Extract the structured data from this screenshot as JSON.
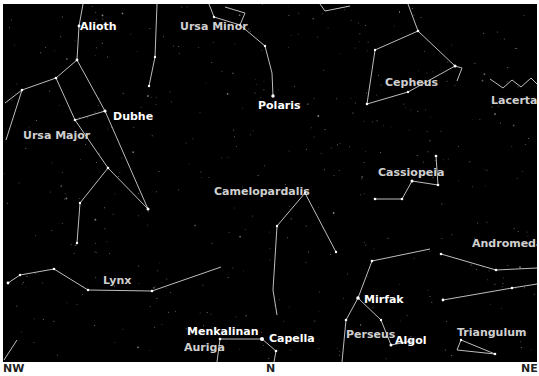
{
  "chart_data": {
    "type": "star-map",
    "title": "",
    "horizon_directions": [
      {
        "label": "NW",
        "x": 3
      },
      {
        "label": "N",
        "x": 270
      },
      {
        "label": "NE",
        "x": 525
      }
    ],
    "constellations": [
      {
        "name": "Ursa Minor",
        "label_x": 207,
        "label_y": 24
      },
      {
        "name": "Cepheus",
        "label_x": 386,
        "label_y": 77
      },
      {
        "name": "Lacerta",
        "label_x": 491,
        "label_y": 95
      },
      {
        "name": "Ursa Major",
        "label_x": 22,
        "label_y": 129
      },
      {
        "name": "Cassiopeia",
        "label_x": 378,
        "label_y": 166
      },
      {
        "name": "Camelopardalis",
        "label_x": 214,
        "label_y": 186
      },
      {
        "name": "Andromeda",
        "label_x": 471,
        "label_y": 238
      },
      {
        "name": "Lynx",
        "label_x": 103,
        "label_y": 275
      },
      {
        "name": "Auriga",
        "label_x": 184,
        "label_y": 342
      },
      {
        "name": "Perseus",
        "label_x": 345,
        "label_y": 328
      },
      {
        "name": "Triangulum",
        "label_x": 456,
        "label_y": 327
      }
    ],
    "stars": [
      {
        "name": "Alioth",
        "label_x": 83,
        "label_y": 25
      },
      {
        "name": "Polaris",
        "label_x": 258,
        "label_y": 100
      },
      {
        "name": "Dubhe",
        "label_x": 112,
        "label_y": 111
      },
      {
        "name": "Mirfak",
        "label_x": 363,
        "label_y": 294
      },
      {
        "name": "Algol",
        "label_x": 394,
        "label_y": 335
      },
      {
        "name": "Menkalinan",
        "label_x": 187,
        "label_y": 326
      },
      {
        "name": "Capella",
        "label_x": 268,
        "label_y": 332
      }
    ]
  },
  "labels": {
    "ursa_minor": "Ursa Minor",
    "cepheus": "Cepheus",
    "lacerta": "Lacerta",
    "ursa_major": "Ursa Major",
    "cassiopeia": "Cassiopeia",
    "camelopardalis": "Camelopardalis",
    "andromeda": "Andromeda",
    "lynx": "Lynx",
    "auriga": "Auriga",
    "perseus": "Perseus",
    "triangulum": "Triangulum",
    "alioth": "Alioth",
    "polaris": "Polaris",
    "dubhe": "Dubhe",
    "mirfak": "Mirfak",
    "algol": "Algol",
    "menkalinan": "Menkalinan",
    "capella": "Capella"
  },
  "directions": {
    "nw": "NW",
    "n": "N",
    "ne": "NE"
  },
  "colors": {
    "sky": "#000000",
    "lines": "#bdbdbd",
    "star_label": "#ffffff",
    "const_label": "#cfcfcf",
    "background": "#ffffff"
  }
}
